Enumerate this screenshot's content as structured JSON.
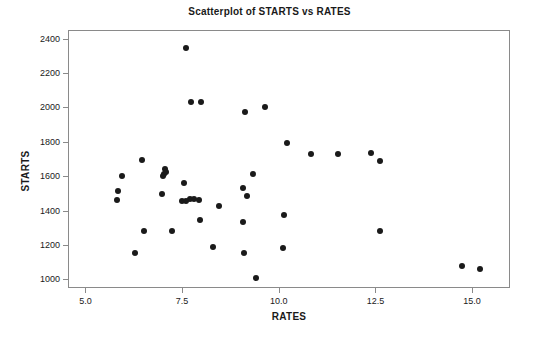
{
  "chart_data": {
    "type": "scatter",
    "title": "Scatterplot of STARTS vs RATES",
    "xlabel": "RATES",
    "ylabel": "STARTS",
    "xlim": [
      4.55,
      15.98
    ],
    "ylim": [
      950,
      2450
    ],
    "xticks": [
      5.0,
      7.5,
      10.0,
      12.5,
      15.0
    ],
    "xtick_labels": [
      "5.0",
      "7.5",
      "10.0",
      "12.5",
      "15.0"
    ],
    "yticks": [
      1000,
      1200,
      1400,
      1600,
      1800,
      2000,
      2200,
      2400
    ],
    "ytick_labels": [
      "1000",
      "1200",
      "1400",
      "1600",
      "1800",
      "2000",
      "2200",
      "2400"
    ],
    "grid": false,
    "legend": false,
    "marker": "filled-circle",
    "marker_color": "#1a1a1a",
    "marker_size_px": 6,
    "n_points": 42,
    "points": [
      {
        "x": 7.57,
        "y": 2350
      },
      {
        "x": 7.7,
        "y": 2040
      },
      {
        "x": 7.97,
        "y": 2035
      },
      {
        "x": 9.09,
        "y": 1980
      },
      {
        "x": 9.61,
        "y": 2010
      },
      {
        "x": 10.2,
        "y": 1800
      },
      {
        "x": 10.8,
        "y": 1735
      },
      {
        "x": 11.5,
        "y": 1735
      },
      {
        "x": 12.35,
        "y": 1740
      },
      {
        "x": 12.6,
        "y": 1695
      },
      {
        "x": 6.45,
        "y": 1700
      },
      {
        "x": 5.92,
        "y": 1605
      },
      {
        "x": 7.02,
        "y": 1645
      },
      {
        "x": 7.0,
        "y": 1620
      },
      {
        "x": 6.99,
        "y": 1605
      },
      {
        "x": 9.3,
        "y": 1620
      },
      {
        "x": 7.52,
        "y": 1565
      },
      {
        "x": 9.05,
        "y": 1540
      },
      {
        "x": 5.82,
        "y": 1520
      },
      {
        "x": 6.95,
        "y": 1505
      },
      {
        "x": 9.15,
        "y": 1488
      },
      {
        "x": 5.8,
        "y": 1470
      },
      {
        "x": 7.48,
        "y": 1460
      },
      {
        "x": 7.67,
        "y": 1472
      },
      {
        "x": 7.78,
        "y": 1475
      },
      {
        "x": 7.9,
        "y": 1470
      },
      {
        "x": 8.44,
        "y": 1430
      },
      {
        "x": 10.1,
        "y": 1378
      },
      {
        "x": 7.93,
        "y": 1353
      },
      {
        "x": 9.04,
        "y": 1338
      },
      {
        "x": 6.48,
        "y": 1290
      },
      {
        "x": 7.22,
        "y": 1285
      },
      {
        "x": 12.58,
        "y": 1290
      },
      {
        "x": 8.28,
        "y": 1195
      },
      {
        "x": 10.08,
        "y": 1190
      },
      {
        "x": 9.08,
        "y": 1158
      },
      {
        "x": 6.26,
        "y": 1162
      },
      {
        "x": 9.38,
        "y": 1013
      },
      {
        "x": 14.72,
        "y": 1082
      },
      {
        "x": 15.18,
        "y": 1065
      },
      {
        "x": 7.05,
        "y": 1632
      },
      {
        "x": 7.57,
        "y": 1462
      }
    ]
  }
}
